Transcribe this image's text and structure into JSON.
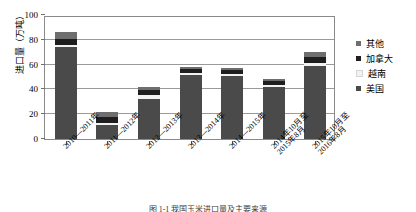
{
  "chart_data": {
    "type": "bar",
    "stacked": true,
    "title": "",
    "xlabel": "",
    "ylabel": "进口量（万吨）",
    "ylim": [
      0,
      100
    ],
    "yticks": [
      0,
      20,
      40,
      60,
      80,
      100
    ],
    "grid": true,
    "legend_position": "right",
    "categories": [
      "2010—2011年",
      "2011—2012年",
      "2012—2013年",
      "2013—2014年",
      "2014—2015年",
      "2014年10月至\n2015年8月",
      "2015年10月至\n2016年8月"
    ],
    "series": [
      {
        "name": "美国",
        "color": "#4a4a4a",
        "values": [
          74.0,
          11.0,
          32.0,
          52.0,
          51.0,
          42.0,
          59.0
        ]
      },
      {
        "name": "越南",
        "color": "#f2f2f2",
        "values": [
          1.5,
          2.0,
          3.5,
          1.5,
          1.5,
          1.5,
          2.0
        ]
      },
      {
        "name": "加拿大",
        "color": "#1e1e1e",
        "values": [
          5.5,
          5.0,
          4.0,
          3.0,
          3.5,
          3.0,
          5.0
        ]
      },
      {
        "name": "其他",
        "color": "#6e6e6e",
        "values": [
          5.0,
          4.0,
          2.5,
          1.5,
          1.5,
          1.5,
          4.0
        ]
      }
    ],
    "totals": [
      86.0,
      22.0,
      42.0,
      58.0,
      57.5,
      48.0,
      70.0
    ]
  },
  "legend": {
    "items": [
      {
        "label": "其他",
        "color": "#6e6e6e"
      },
      {
        "label": "加拿大",
        "color": "#1e1e1e"
      },
      {
        "label": "越南",
        "color": "#f2f2f2"
      },
      {
        "label": "美国",
        "color": "#4a4a4a"
      }
    ]
  },
  "caption": "图 1-1  我国玉米进口量及主要来源"
}
